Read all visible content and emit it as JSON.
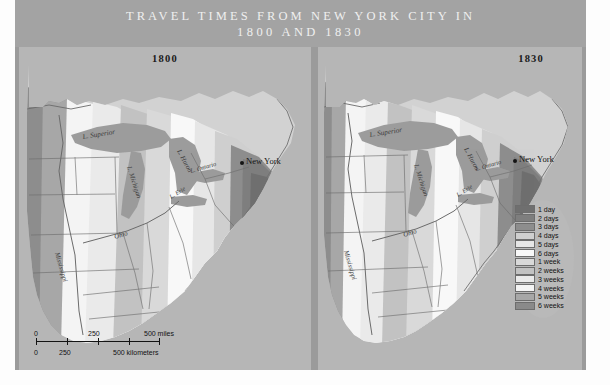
{
  "figure": {
    "title_line1": "TRAVEL TIMES FROM NEW YORK CITY IN",
    "title_line2": "1800 AND 1830"
  },
  "panels": [
    {
      "year": "1800",
      "city_label": "New York",
      "water_labels": [
        "L. Superior",
        "L. Michigan",
        "L. Huron",
        "L. Erie",
        "L. Ontario"
      ],
      "river_labels": [
        "Mississippi",
        "Ohio"
      ]
    },
    {
      "year": "1830",
      "city_label": "New York",
      "water_labels": [
        "L. Superior",
        "L. Michigan",
        "L. Huron",
        "L. Erie",
        "L. Ontario"
      ],
      "river_labels": [
        "Mississippi",
        "Ohio"
      ]
    }
  ],
  "legend": {
    "entries": [
      {
        "label": "1 day",
        "color": "#6f6f6f"
      },
      {
        "label": "2 days",
        "color": "#7e7e7e"
      },
      {
        "label": "3 days",
        "color": "#8d8d8d"
      },
      {
        "label": "4 days",
        "color": "#cfcfcf"
      },
      {
        "label": "5 days",
        "color": "#e6e6e6"
      },
      {
        "label": "6 days",
        "color": "#f8f8f8"
      },
      {
        "label": "1 week",
        "color": "#d9d9d9"
      },
      {
        "label": "2 weeks",
        "color": "#c2c2c2"
      },
      {
        "label": "3 weeks",
        "color": "#eaeaea"
      },
      {
        "label": "4 weeks",
        "color": "#f4f4f4"
      },
      {
        "label": "5 weeks",
        "color": "#a7a7a7"
      },
      {
        "label": "6 weeks",
        "color": "#8a8a8a"
      }
    ]
  },
  "scale_bar": {
    "miles": {
      "start": "0",
      "mid": "250",
      "end": "500 miles"
    },
    "kilometers": {
      "start": "0",
      "mid": "250",
      "end": "500 kilometers"
    }
  },
  "chart_data": {
    "type": "map",
    "title": "Travel times from New York City in 1800 and 1830",
    "map_kind": "isochrone / travel-time contour map",
    "region": "Eastern United States",
    "origin_city": "New York",
    "panels": [
      {
        "year": 1800,
        "note": "Isochrones tightly clustered around New York; 6 weeks reaches only to the Mississippi/Great Lakes frontier."
      },
      {
        "year": 1830,
        "note": "Isochrones expanded westward; 1-2 week bands reach the Ohio valley and Great Lakes."
      }
    ],
    "isochrone_levels": [
      "1 day",
      "2 days",
      "3 days",
      "4 days",
      "5 days",
      "6 days",
      "1 week",
      "2 weeks",
      "3 weeks",
      "4 weeks",
      "5 weeks",
      "6 weeks"
    ],
    "scale_miles": [
      0,
      250,
      500
    ],
    "scale_kilometers": [
      0,
      250,
      500
    ],
    "legend_position": "lower right"
  }
}
